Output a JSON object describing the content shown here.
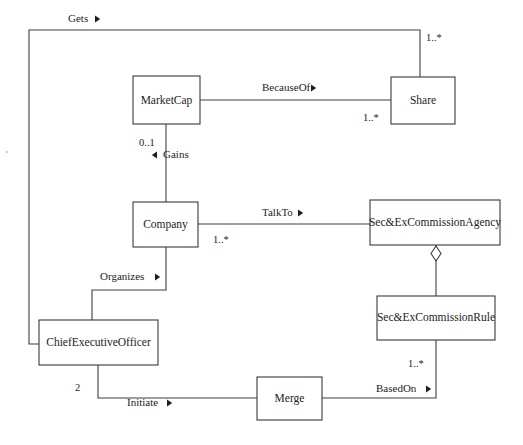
{
  "diagram": {
    "type": "class-diagram",
    "classes": [
      {
        "id": "marketcap",
        "name": "MarketCap",
        "x": 133,
        "y": 76,
        "w": 67,
        "h": 48
      },
      {
        "id": "share",
        "name": "Share",
        "x": 391,
        "y": 77,
        "w": 64,
        "h": 47
      },
      {
        "id": "company",
        "name": "Company",
        "x": 133,
        "y": 202,
        "w": 65,
        "h": 45
      },
      {
        "id": "agency",
        "name": "Sec&ExCommissionAgency",
        "x": 370,
        "y": 200,
        "w": 130,
        "h": 45
      },
      {
        "id": "rule",
        "name": "Sec&ExCommissionRule",
        "x": 377,
        "y": 296,
        "w": 118,
        "h": 44
      },
      {
        "id": "ceo",
        "name": "ChiefExecutiveOfficer",
        "x": 39,
        "y": 320,
        "w": 119,
        "h": 45
      },
      {
        "id": "merge",
        "name": "Merge",
        "x": 257,
        "y": 377,
        "w": 65,
        "h": 43
      }
    ],
    "associations": [
      {
        "id": "gets",
        "label": "Gets",
        "direction": "right",
        "from": "ceo",
        "to": "share",
        "label_x": 68,
        "label_y": 22
      },
      {
        "id": "becauseof",
        "label": "BecauseOf",
        "direction": "right",
        "from": "marketcap",
        "to": "share",
        "label_x": 262,
        "label_y": 91
      },
      {
        "id": "gains",
        "label": "Gains",
        "direction": "left",
        "from": "company",
        "to": "marketcap",
        "label_x": 158,
        "label_y": 158
      },
      {
        "id": "talkto",
        "label": "TalkTo",
        "direction": "right",
        "from": "company",
        "to": "agency",
        "label_x": 262,
        "label_y": 216
      },
      {
        "id": "organizes",
        "label": "Organizes",
        "direction": "right",
        "from": "company",
        "to": "ceo",
        "label_x": 100,
        "label_y": 280
      },
      {
        "id": "initiate",
        "label": "Initiate",
        "direction": "right",
        "from": "ceo",
        "to": "merge",
        "label_x": 127,
        "label_y": 406
      },
      {
        "id": "basedon",
        "label": "BasedOn",
        "direction": "right",
        "from": "merge",
        "to": "rule",
        "label_x": 376,
        "label_y": 392
      }
    ],
    "aggregation": {
      "id": "agency-rule-aggregation",
      "whole": "agency",
      "part": "rule"
    },
    "multiplicities": [
      {
        "id": "share-top",
        "value": "1..*",
        "x": 426,
        "y": 41
      },
      {
        "id": "share-left",
        "value": "1..*",
        "x": 363,
        "y": 121
      },
      {
        "id": "marketcap-bottom",
        "value": "0..1",
        "x": 139,
        "y": 146
      },
      {
        "id": "company-right",
        "value": "1..*",
        "x": 213,
        "y": 243
      },
      {
        "id": "ceo-bottom",
        "value": "2",
        "x": 75,
        "y": 391
      },
      {
        "id": "rule-bottom",
        "value": "1..*",
        "x": 408,
        "y": 367
      }
    ],
    "colors": {
      "background": "#ffffff",
      "stroke": "#3f3f3f",
      "text": "#1c1c1c"
    }
  }
}
